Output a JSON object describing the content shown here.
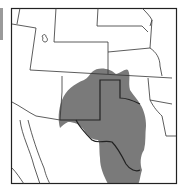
{
  "map": {
    "title": "",
    "region": "Southwestern United States range map",
    "colors": {
      "background": "#ffffff",
      "range_fill": "#7a7a7a",
      "state_lines": "#333333",
      "frame": "#222222"
    },
    "legend": []
  }
}
